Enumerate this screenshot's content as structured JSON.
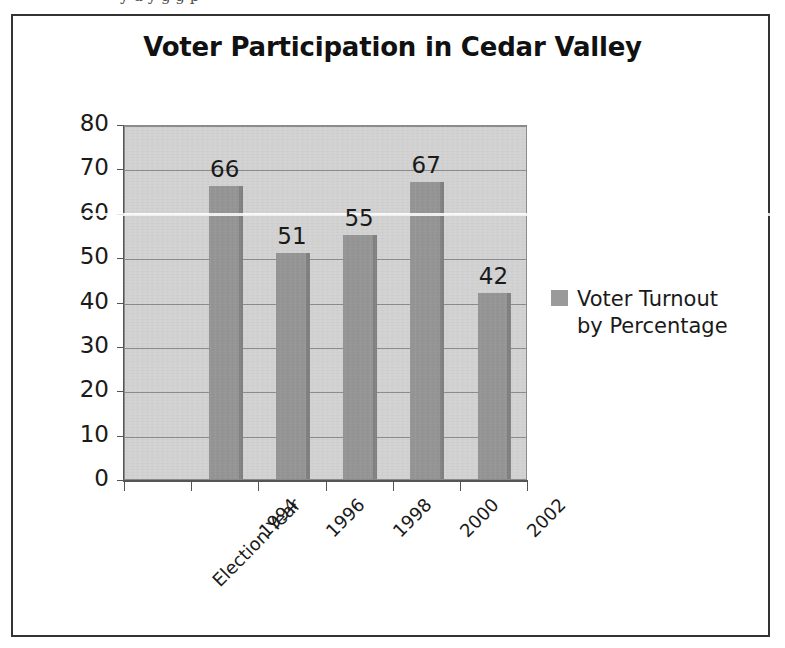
{
  "frame": {
    "border_color": "#333333",
    "background": "#ffffff"
  },
  "scan_artifacts": {
    "top_text": "y   u   y     g g p"
  },
  "chart_data": {
    "type": "bar",
    "title": "Voter Participation in Cedar Valley",
    "xlabel": "",
    "ylabel": "",
    "categories": [
      "Election Year",
      "1994",
      "1996",
      "1998",
      "2000",
      "2002"
    ],
    "values": [
      null,
      66,
      51,
      55,
      67,
      42
    ],
    "data_labels": [
      "",
      "66",
      "51",
      "55",
      "67",
      "42"
    ],
    "series": [
      {
        "name": "Voter Turnout by Percentage",
        "values": [
          null,
          66,
          51,
          55,
          67,
          42
        ],
        "color": "#969696"
      }
    ],
    "ylim": [
      0,
      80
    ],
    "ytick_step": 10,
    "ytick_labels": [
      "80",
      "70",
      "60",
      "50",
      "40",
      "30",
      "20",
      "10",
      "0"
    ],
    "ytick_values": [
      80,
      70,
      60,
      50,
      40,
      30,
      20,
      10,
      0
    ],
    "grid": true,
    "grid_axis": "y",
    "legend_position": "right",
    "plot_background": "#d4d4d4",
    "gridline_color": "#8c8c8c",
    "xtick_label_rotation": -45
  },
  "legend": {
    "entries": [
      {
        "label": "Voter Turnout by Percentage",
        "color": "#969696"
      }
    ]
  }
}
